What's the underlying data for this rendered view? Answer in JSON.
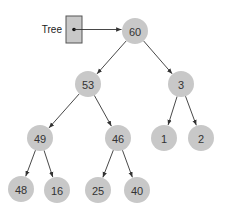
{
  "diagram": {
    "type": "binary-tree",
    "pointer": {
      "label": "Tree",
      "box": {
        "x": 66,
        "y": 16,
        "w": 16,
        "h": 27
      },
      "target": "n60"
    },
    "colors": {
      "node_fill": "#c8c8c8",
      "box_fill": "#c8c8c8",
      "edge": "#333333",
      "text": "#333333"
    },
    "node_radius": 13,
    "nodes": [
      {
        "id": "n60",
        "value": "60",
        "x": 135,
        "y": 31
      },
      {
        "id": "n53",
        "value": "53",
        "x": 88,
        "y": 84
      },
      {
        "id": "n3",
        "value": "3",
        "x": 181,
        "y": 84
      },
      {
        "id": "n49",
        "value": "49",
        "x": 40,
        "y": 138
      },
      {
        "id": "n46",
        "value": "46",
        "x": 118,
        "y": 138
      },
      {
        "id": "n1",
        "value": "1",
        "x": 164,
        "y": 138
      },
      {
        "id": "n2",
        "value": "2",
        "x": 201,
        "y": 138
      },
      {
        "id": "n48",
        "value": "48",
        "x": 21,
        "y": 189
      },
      {
        "id": "n16",
        "value": "16",
        "x": 57,
        "y": 190
      },
      {
        "id": "n25",
        "value": "25",
        "x": 98,
        "y": 190
      },
      {
        "id": "n40",
        "value": "40",
        "x": 137,
        "y": 190
      }
    ],
    "edges": [
      {
        "from": "n60",
        "to": "n53"
      },
      {
        "from": "n60",
        "to": "n3"
      },
      {
        "from": "n53",
        "to": "n49"
      },
      {
        "from": "n53",
        "to": "n46"
      },
      {
        "from": "n3",
        "to": "n1"
      },
      {
        "from": "n3",
        "to": "n2"
      },
      {
        "from": "n49",
        "to": "n48"
      },
      {
        "from": "n49",
        "to": "n16"
      },
      {
        "from": "n46",
        "to": "n25"
      },
      {
        "from": "n46",
        "to": "n40"
      }
    ]
  }
}
